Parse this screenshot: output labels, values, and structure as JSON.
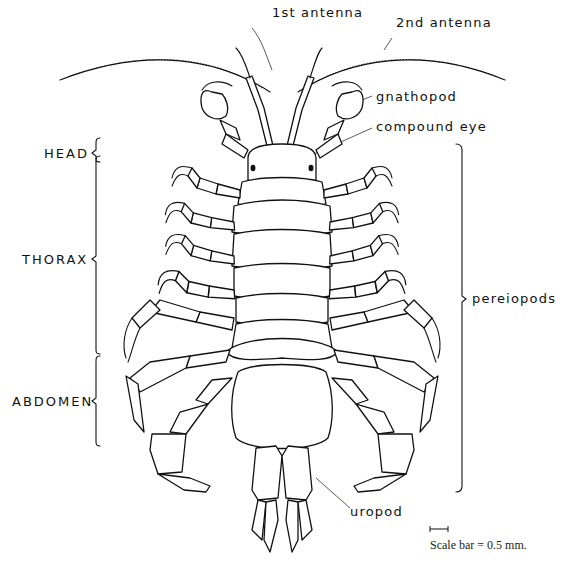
{
  "figure": {
    "labels": {
      "antenna1": "1st antenna",
      "antenna2": "2nd antenna",
      "gnathopod": "gnathopod",
      "compound_eye": "compound eye",
      "pereiopods": "pereiopods",
      "uropod": "uropod"
    },
    "regions": {
      "head": "HEAD",
      "thorax": "THORAX",
      "abdomen": "ABDOMEN"
    },
    "scale": {
      "text": "Scale bar = 0.5 mm."
    },
    "colors": {
      "ink": "#111111",
      "background": "#ffffff"
    }
  }
}
